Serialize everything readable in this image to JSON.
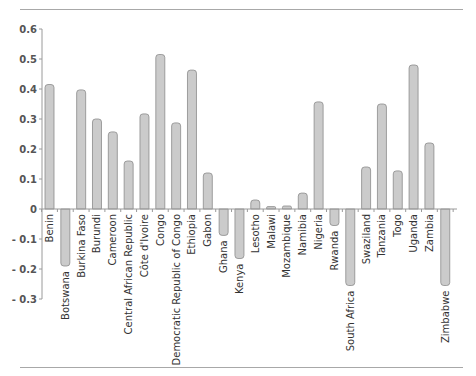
{
  "chart_data": {
    "type": "bar",
    "title": "",
    "xlabel": "",
    "ylabel": "",
    "ylim": [
      -0.3,
      0.6
    ],
    "yticks": [
      0.6,
      0.5,
      0.4,
      0.3,
      0.2,
      0.1,
      0,
      -0.1,
      -0.2,
      -0.3
    ],
    "ytick_labels": [
      "0.6",
      "0.5",
      "0.4",
      "0.3",
      "0.2",
      "0.1",
      "0",
      "- 0.1",
      "- 0.2",
      "- 0.3"
    ],
    "grid": false,
    "legend": null,
    "categories": [
      "Benin",
      "Botswana",
      "Burkina Faso",
      "Burundi",
      "Cameroon",
      "Central African Republic",
      "Côte d'Ivoire",
      "Congo",
      "Democratic Republic of Congo",
      "Ethiopia",
      "Gabon",
      "Ghana",
      "Kenya",
      "Lesotho",
      "Malawi",
      "Mozambique",
      "Namibia",
      "Nigeria",
      "Rwanda",
      "South Africa",
      "Swaziland",
      "Tanzania",
      "Togo",
      "Uganda",
      "Zambia",
      "Zimbabwe"
    ],
    "values": [
      0.415,
      -0.19,
      0.397,
      0.3,
      0.257,
      0.16,
      0.317,
      0.515,
      0.287,
      0.463,
      0.12,
      -0.088,
      -0.165,
      0.03,
      0.008,
      0.01,
      0.053,
      0.357,
      -0.055,
      -0.255,
      0.14,
      0.35,
      0.127,
      0.48,
      0.22,
      -0.255
    ],
    "colors": {
      "bar_fill": "#cbcbcb",
      "bar_stroke": "#8c8c8c",
      "axis": "#9a9a9a",
      "rule": "#a8a8a8"
    }
  }
}
